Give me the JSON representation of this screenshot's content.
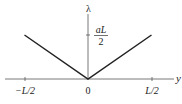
{
  "chart_data": {
    "type": "line",
    "title": "",
    "xlabel": "y",
    "ylabel": "λ",
    "x_ticks": [
      "−L/2",
      "0",
      "L/2"
    ],
    "y_tick_numerator": "aL",
    "y_tick_denominator": "2",
    "xlim": [
      -0.65,
      0.7
    ],
    "ylim": [
      0,
      1.2
    ],
    "series": [
      {
        "name": "lambda(y) = a|y|",
        "x": [
          -0.5,
          0,
          0.5
        ],
        "y": [
          0.5,
          0,
          0.5
        ]
      }
    ],
    "grid": false,
    "legend": "none"
  },
  "colors": {
    "line": "#222222",
    "axis": "#555555"
  }
}
